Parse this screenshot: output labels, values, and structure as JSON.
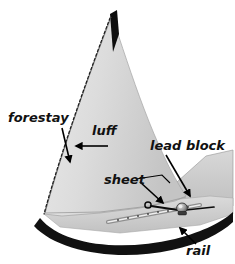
{
  "figure": {
    "background_color": "#ffffff",
    "width": 235,
    "height": 264
  },
  "colors": {
    "background": "#ffffff",
    "sail_light": "#e4e4e4",
    "sail_mid": "#d2d2d2",
    "sail_shadow": "#bdbdbd",
    "hull_dark": "#111111",
    "deck_gray": "#cfcfcf",
    "deck_gray_light": "#dedede",
    "line_black": "#000000",
    "metal_gray": "#9a9a9a",
    "label_color": "#111111"
  },
  "labels": [
    {
      "id": "forestay",
      "text": "forestay",
      "x": 8,
      "y": 122,
      "font_size": 13,
      "arrow_from": [
        62,
        128
      ],
      "arrow_to": [
        70,
        162
      ]
    },
    {
      "id": "luff",
      "text": "luff",
      "x": 92,
      "y": 135,
      "font_size": 13,
      "arrow_from": [
        108,
        146
      ],
      "arrow_to": [
        76,
        146
      ]
    },
    {
      "id": "lead-block",
      "text": "lead block",
      "x": 150,
      "y": 150,
      "font_size": 13,
      "arrow_from": [
        166,
        155
      ],
      "arrow_to": [
        190,
        196
      ]
    },
    {
      "id": "sheet",
      "text": "sheet",
      "x": 104,
      "y": 184,
      "font_size": 13,
      "arrow_from": [
        140,
        182
      ],
      "arrow_to": [
        163,
        203
      ]
    },
    {
      "id": "rail",
      "text": "rail",
      "x": 186,
      "y": 255,
      "font_size": 13,
      "arrow_from": [
        196,
        244
      ],
      "arrow_to": [
        180,
        228
      ]
    }
  ],
  "parts": {
    "sail": {
      "name": "jib-sail",
      "description": "large triangular headsail with curved leech"
    },
    "forestay_line": {
      "name": "forestay",
      "style": "dashed",
      "description": "dashed line along sail leading edge"
    },
    "luff_edge": {
      "name": "luff",
      "description": "leading edge of the sail"
    },
    "mast_tip": {
      "name": "mast-head",
      "description": "dark sliver at sail apex"
    },
    "hull": {
      "name": "hull",
      "description": "dark curved hull band"
    },
    "deck": {
      "name": "deck",
      "description": "light gray foredeck surface"
    },
    "rail_track": {
      "name": "rail-track",
      "description": "perforated genoa track along deck edge"
    },
    "block": {
      "name": "lead-block",
      "description": "metallic sheet lead block on track"
    },
    "sheet_line": {
      "name": "sheet-line",
      "description": "rope from clew ring running aft to block"
    },
    "clew_ring": {
      "name": "clew-ring",
      "description": "small ring at sail clew"
    },
    "second_sail": {
      "name": "aft-sail",
      "description": "gray sail panel at right edge"
    }
  }
}
